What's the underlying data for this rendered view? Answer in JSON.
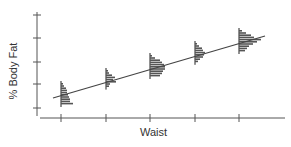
{
  "chart_data": {
    "type": "line",
    "title": "",
    "xlabel": "Waist",
    "ylabel": "% Body Fat",
    "x_ticks": 5,
    "y_ticks": 5,
    "tick_labels_shown": false,
    "grid": false,
    "legend": null,
    "regression_line": {
      "x_start": 0.0,
      "y_start": 0.7,
      "x_end": 4.6,
      "y_end": 3.3
    },
    "series": [
      {
        "name": "regression line",
        "type": "line",
        "x": [
          -0.2,
          4.6
        ],
        "y": [
          0.45,
          3.15
        ]
      },
      {
        "name": "conditional distributions",
        "type": "histogram-vertical",
        "groups": [
          {
            "x": 0,
            "center_y": 0.65,
            "bars": [
              2,
              3,
              5,
              6,
              6,
              7,
              8,
              9,
              9,
              12
            ]
          },
          {
            "x": 1,
            "center_y": 1.1,
            "bars": [
              2,
              3,
              6,
              9,
              7,
              10,
              4,
              3
            ]
          },
          {
            "x": 2,
            "center_y": 1.85,
            "bars": [
              2,
              5,
              10,
              12,
              14,
              15,
              15,
              13,
              12,
              10
            ]
          },
          {
            "x": 3,
            "center_y": 2.35,
            "bars": [
              2,
              4,
              7,
              8,
              10,
              9,
              8,
              5,
              3
            ]
          },
          {
            "x": 4,
            "center_y": 2.95,
            "bars": [
              3,
              7,
              12,
              15,
              22,
              18,
              14,
              10,
              8,
              6
            ]
          }
        ]
      }
    ],
    "annotations": []
  },
  "axes": {
    "xlabel": "Waist",
    "ylabel": "% Body Fat"
  }
}
